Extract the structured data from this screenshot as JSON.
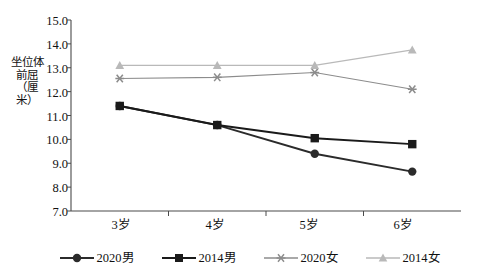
{
  "chart_data": {
    "type": "line",
    "title": "",
    "xlabel": "",
    "ylabel": "坐位体前屈（厘米）",
    "categories": [
      "3岁",
      "4岁",
      "5岁",
      "6岁"
    ],
    "ylim": [
      7.0,
      15.0
    ],
    "ytick_step": 1.0,
    "yticks": [
      "15.0",
      "14.0",
      "13.0",
      "12.0",
      "11.0",
      "10.0",
      "9.0",
      "8.0",
      "7.0"
    ],
    "grid": false,
    "legend_position": "bottom",
    "series": [
      {
        "name": "2020男",
        "marker": "circle",
        "color": "#2b2b2b",
        "values": [
          11.4,
          10.6,
          9.4,
          8.65
        ]
      },
      {
        "name": "2014男",
        "marker": "square",
        "color": "#1a1a1a",
        "values": [
          11.4,
          10.6,
          10.05,
          9.8
        ]
      },
      {
        "name": "2020女",
        "marker": "asterisk",
        "color": "#8c8c8c",
        "values": [
          12.55,
          12.6,
          12.8,
          12.1
        ]
      },
      {
        "name": "2014女",
        "marker": "triangle",
        "color": "#b9b9b9",
        "values": [
          13.1,
          13.1,
          13.1,
          13.75
        ]
      }
    ]
  },
  "axis": {
    "line_color": "#4a4a4a"
  },
  "legend": {
    "items": [
      {
        "label": "2020男"
      },
      {
        "label": "2014男"
      },
      {
        "label": "2020女"
      },
      {
        "label": "2014女"
      }
    ]
  }
}
